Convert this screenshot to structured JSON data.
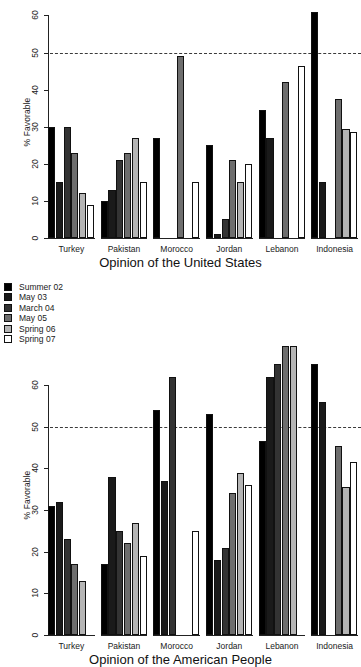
{
  "legend": {
    "position": "left-middle",
    "entries": [
      {
        "label": "Summer 02",
        "color": "#000000"
      },
      {
        "label": "May 03",
        "color": "#1a1a1a"
      },
      {
        "label": "March 04",
        "color": "#333333"
      },
      {
        "label": "May 05",
        "color": "#6e6e6e"
      },
      {
        "label": "Spring 06",
        "color": "#b5b5b5"
      },
      {
        "label": "Spring 07",
        "color": "#ffffff"
      }
    ]
  },
  "chart_data": [
    {
      "type": "bar",
      "id": "opinion-united-states",
      "title": "Opinion of the United States",
      "xlabel": "",
      "ylabel": "% Favorable",
      "ylim": [
        0,
        62
      ],
      "yticks": [
        0,
        10,
        20,
        30,
        40,
        50,
        60
      ],
      "ytick_labels": [
        "0",
        "10",
        "20",
        "30",
        "40",
        "50",
        "60"
      ],
      "grid": false,
      "reference_line": {
        "value": 50,
        "style": "dashed"
      },
      "categories": [
        "Turkey",
        "Pakistan",
        "Morocco",
        "Jordan",
        "Lebanon",
        "Indonesia"
      ],
      "series": [
        {
          "name": "Summer 02",
          "values": [
            30,
            10,
            27,
            25,
            34.5,
            61
          ]
        },
        {
          "name": "May 03",
          "values": [
            15,
            13,
            null,
            1,
            27,
            15
          ]
        },
        {
          "name": "March 04",
          "values": [
            30,
            21,
            null,
            5,
            null,
            null
          ]
        },
        {
          "name": "May 05",
          "values": [
            23,
            23,
            49,
            21,
            42,
            37.5
          ]
        },
        {
          "name": "Spring 06",
          "values": [
            12,
            27,
            null,
            15,
            null,
            29.5
          ]
        },
        {
          "name": "Spring 07",
          "values": [
            9,
            15,
            15,
            20,
            46.5,
            28.5
          ]
        }
      ]
    },
    {
      "type": "bar",
      "id": "opinion-american-people",
      "title": "Opinion of the American People",
      "xlabel": "",
      "ylabel": "% Favorable",
      "ylim": [
        0,
        67
      ],
      "yticks": [
        0,
        10,
        20,
        30,
        40,
        50,
        60
      ],
      "ytick_labels": [
        "0",
        "10",
        "20",
        "30",
        "40",
        "50",
        "60"
      ],
      "grid": false,
      "note": "Top of plot is clipped by the image edge; tallest Lebanon bars extend past the visible area.",
      "reference_line": {
        "value": 50,
        "style": "dashed"
      },
      "categories": [
        "Turkey",
        "Pakistan",
        "Morocco",
        "Jordan",
        "Lebanon",
        "Indonesia"
      ],
      "series": [
        {
          "name": "Summer 02",
          "values": [
            31,
            17,
            54,
            53,
            46.5,
            65
          ]
        },
        {
          "name": "May 03",
          "values": [
            32,
            38,
            37,
            18,
            62,
            56
          ]
        },
        {
          "name": "March 04",
          "values": [
            23,
            25,
            62,
            21,
            65,
            null
          ]
        },
        {
          "name": "May 05",
          "values": [
            17,
            22,
            null,
            34,
            70,
            45.5
          ]
        },
        {
          "name": "Spring 06",
          "values": [
            13,
            27,
            null,
            39,
            71,
            35.5
          ]
        },
        {
          "name": "Spring 07",
          "values": [
            null,
            19,
            25,
            36,
            null,
            41.5
          ]
        }
      ]
    }
  ]
}
